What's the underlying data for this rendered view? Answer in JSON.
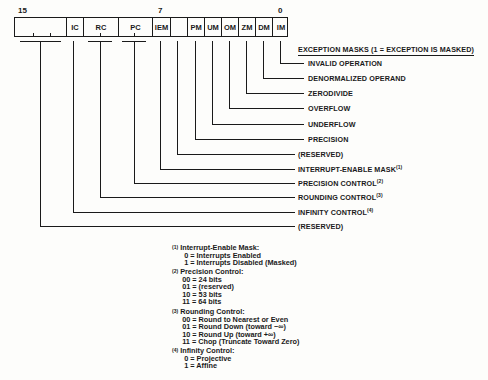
{
  "bit_numbers": {
    "high": "15",
    "mid": "7",
    "low": "0"
  },
  "register_cells": [
    {
      "label": "",
      "name": "reserved-high"
    },
    {
      "label": "IC",
      "name": "ic"
    },
    {
      "label": "RC",
      "name": "rc"
    },
    {
      "label": "PC",
      "name": "pc"
    },
    {
      "label": "IEM",
      "name": "iem"
    },
    {
      "label": "",
      "name": "reserved-bit6"
    },
    {
      "label": "PM",
      "name": "pm"
    },
    {
      "label": "UM",
      "name": "um"
    },
    {
      "label": "OM",
      "name": "om"
    },
    {
      "label": "ZM",
      "name": "zm"
    },
    {
      "label": "DM",
      "name": "dm"
    },
    {
      "label": "IM",
      "name": "im"
    }
  ],
  "exception_header": "EXCEPTION MASKS (1 = EXCEPTION IS MASKED)",
  "labels": {
    "invalid_operation": "INVALID OPERATION",
    "denormalized_operand": "DENORMALIZED OPERAND",
    "zerodivide": "ZERODIVIDE",
    "overflow": "OVERFLOW",
    "underflow": "UNDERFLOW",
    "precision": "PRECISION",
    "reserved_bit6": "(RESERVED)",
    "interrupt_enable_mask": "INTERRUPT-ENABLE MASK",
    "interrupt_enable_mask_note": "(1)",
    "precision_control": "PRECISION CONTROL",
    "precision_control_note": "(2)",
    "rounding_control": "ROUNDING CONTROL",
    "rounding_control_note": "(3)",
    "infinity_control": "INFINITY CONTROL",
    "infinity_control_note": "(4)",
    "reserved_high": "(RESERVED)"
  },
  "footnotes": [
    {
      "mark": "(1)",
      "title": "Interrupt-Enable Mask:",
      "lines": [
        "0 = Interrupts Enabled",
        "1 = Interrupts Disabled (Masked)"
      ]
    },
    {
      "mark": "(2)",
      "title": "Precision Control:",
      "lines": [
        "00 = 24 bits",
        "01 = (reserved)",
        "10 = 53 bits",
        "11 = 64 bits"
      ]
    },
    {
      "mark": "(3)",
      "title": "Rounding Control:",
      "lines": [
        "00 = Round to Nearest or Even",
        "01 = Round Down (toward −∞)",
        "10 = Round Up (toward +∞)",
        "11 = Chop (Truncate Toward Zero)"
      ]
    },
    {
      "mark": "(4)",
      "title": "Infinity Control:",
      "lines": [
        "0 = Projective",
        "1 = Affine"
      ]
    }
  ]
}
